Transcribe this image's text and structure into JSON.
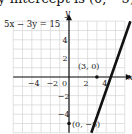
{
  "caption": "y-intercept is (0, −5)",
  "chart_data": {
    "type": "line",
    "title": "",
    "equation": "5x − 3y = 15",
    "xlabel": "x",
    "ylabel": "y",
    "xlim": [
      -6,
      6
    ],
    "ylim": [
      -6,
      6
    ],
    "grid": true,
    "x_ticks": [
      -4,
      -2,
      0,
      2,
      4
    ],
    "y_ticks": [
      4,
      2,
      -2,
      -4
    ],
    "x_tick_labels": [
      "−4",
      "−2",
      "0",
      "2",
      "4"
    ],
    "y_tick_labels": [
      "4",
      "2",
      "−2",
      "−4"
    ],
    "series": [
      {
        "name": "5x − 3y = 15",
        "x": [
          2.4,
          6.6
        ],
        "y": [
          -6,
          6
        ],
        "color": "#111111"
      }
    ],
    "points": [
      {
        "label": "(3, 0)",
        "x": 3,
        "y": 0
      },
      {
        "label": "(0, −5)",
        "x": 0,
        "y": -5
      }
    ]
  }
}
